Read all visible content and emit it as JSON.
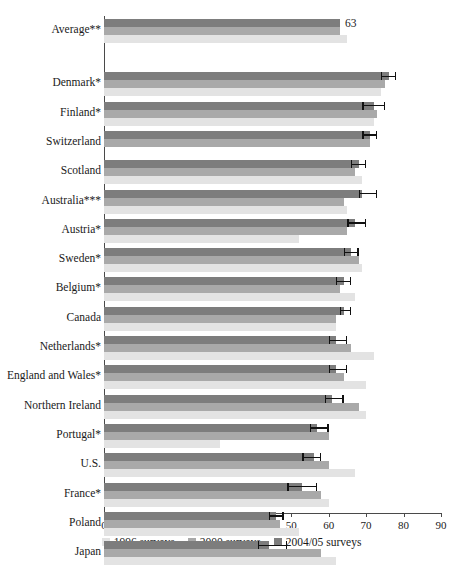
{
  "chart_data": {
    "type": "bar",
    "orientation": "horizontal",
    "title": "",
    "subtitle": "",
    "xlabel": "",
    "ylabel": "",
    "xlim": [
      0,
      90
    ],
    "xticks": [
      0,
      10,
      20,
      30,
      40,
      50,
      60,
      70,
      80,
      90
    ],
    "grid": false,
    "legend_position": "bottom",
    "stacked_appearance": "overlapping horizontal bars, one per survey year",
    "categories": [
      "Average**",
      "Denmark*",
      "Finland*",
      "Switzerland",
      "Scotland",
      "Australia***",
      "Austria*",
      "Sweden*",
      "Belgium*",
      "Canada",
      "Netherlands*",
      "England and Wales*",
      "Northern Ireland",
      "Portugal*",
      "U.S.",
      "France*",
      "Poland",
      "Japan"
    ],
    "series": [
      {
        "name": "1996 surveys",
        "color": "#e3e3e3",
        "values": [
          65,
          74,
          72,
          null,
          69,
          65,
          52,
          69,
          67,
          62,
          72,
          70,
          70,
          31,
          67,
          60,
          52,
          62
        ]
      },
      {
        "name": "2000 surveys",
        "color": "#a9a9a9",
        "values": [
          63,
          75,
          73,
          71,
          67,
          64,
          65,
          68,
          63,
          62,
          66,
          64,
          68,
          60,
          60,
          58,
          47,
          58
        ]
      },
      {
        "name": "2004/05 surveys",
        "color": "#7d7d7d",
        "values": [
          63,
          76,
          72,
          71,
          68,
          69,
          67,
          66,
          64,
          64,
          62,
          62,
          61,
          57,
          56,
          53,
          46,
          44
        ]
      }
    ],
    "error_bars": {
      "series": "2004/05 surveys",
      "values": [
        {
          "category": "Average**",
          "low": null,
          "high": null
        },
        {
          "category": "Denmark*",
          "low": 74,
          "high": 78
        },
        {
          "category": "Finland*",
          "low": 69,
          "high": 75
        },
        {
          "category": "Switzerland",
          "low": 69,
          "high": 73
        },
        {
          "category": "Scotland",
          "low": 66,
          "high": 70
        },
        {
          "category": "Australia***",
          "low": 68,
          "high": 73
        },
        {
          "category": "Austria*",
          "low": 65,
          "high": 70
        },
        {
          "category": "Sweden*",
          "low": 64,
          "high": 68
        },
        {
          "category": "Belgium*",
          "low": 62,
          "high": 66
        },
        {
          "category": "Canada",
          "low": 63,
          "high": 66
        },
        {
          "category": "Netherlands*",
          "low": 60,
          "high": 65
        },
        {
          "category": "England and Wales*",
          "low": 60,
          "high": 65
        },
        {
          "category": "Northern Ireland",
          "low": 59,
          "high": 64
        },
        {
          "category": "Portugal*",
          "low": 55,
          "high": 60
        },
        {
          "category": "U.S.",
          "low": 53,
          "high": 58
        },
        {
          "category": "France*",
          "low": 49,
          "high": 57
        },
        {
          "category": "Poland",
          "low": 44,
          "high": 48
        },
        {
          "category": "Japan",
          "low": 41,
          "high": 49
        }
      ]
    },
    "data_labels": [
      {
        "category": "Average**",
        "series": "2004/05 surveys",
        "text": "63",
        "value": 63
      }
    ]
  },
  "legend": {
    "items": [
      {
        "label": "1996 surveys",
        "color": "#e3e3e3"
      },
      {
        "label": "2000 surveys",
        "color": "#a9a9a9"
      },
      {
        "label": "2004/05 surveys",
        "color": "#7d7d7d"
      }
    ]
  },
  "axis": {
    "tick_labels": [
      "0",
      "10",
      "20",
      "30",
      "40",
      "50",
      "60",
      "70",
      "80",
      "90"
    ]
  }
}
